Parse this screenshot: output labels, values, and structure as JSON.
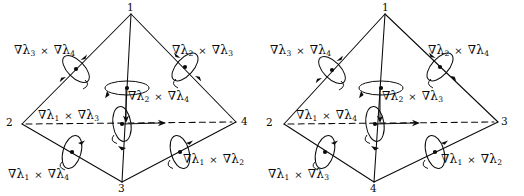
{
  "figure": {
    "name": "tetrahedron-edge-curl-diagram",
    "ink_color": "#0a0a0a",
    "background_color": "#ffffff",
    "panel_count": 2
  },
  "panels": [
    {
      "id": "left-tetrahedron",
      "vertices": [
        {
          "id": "apex",
          "label": "1"
        },
        {
          "id": "left",
          "label": "2"
        },
        {
          "id": "bottom",
          "label": "3"
        },
        {
          "id": "right",
          "label": "4"
        }
      ],
      "labels": [
        {
          "id": "top-left",
          "text": "∇λ3 × ∇λ4",
          "a": "3",
          "b": "4"
        },
        {
          "id": "top-right",
          "text": "∇λ2 × ∇λ3",
          "a": "2",
          "b": "3"
        },
        {
          "id": "center",
          "text": "∇λ2 × ∇λ4",
          "a": "2",
          "b": "4"
        },
        {
          "id": "middle-left",
          "text": "∇λ1 × ∇λ3",
          "a": "1",
          "b": "3"
        },
        {
          "id": "bottom-left",
          "text": "∇λ1 × ∇λ4",
          "a": "1",
          "b": "4"
        },
        {
          "id": "bottom-right",
          "text": "∇λ1 × ∇λ2",
          "a": "1",
          "b": "2"
        }
      ]
    },
    {
      "id": "right-tetrahedron",
      "vertices": [
        {
          "id": "apex",
          "label": "1"
        },
        {
          "id": "left",
          "label": "2"
        },
        {
          "id": "bottom",
          "label": "4"
        },
        {
          "id": "right",
          "label": "3"
        }
      ],
      "labels": [
        {
          "id": "top-left",
          "text": "∇λ3 × ∇λ4",
          "a": "3",
          "b": "4"
        },
        {
          "id": "top-right",
          "text": "∇λ2 × ∇λ4",
          "a": "2",
          "b": "4"
        },
        {
          "id": "center",
          "text": "∇λ2 × ∇λ3",
          "a": "2",
          "b": "3"
        },
        {
          "id": "middle-left",
          "text": "∇λ1 × ∇λ4",
          "a": "1",
          "b": "4"
        },
        {
          "id": "bottom-left",
          "text": "∇λ1 × ∇λ3",
          "a": "1",
          "b": "3"
        },
        {
          "id": "bottom-right",
          "text": "∇λ1 × ∇λ2",
          "a": "1",
          "b": "2"
        }
      ]
    }
  ],
  "symbols": {
    "nabla": "∇",
    "lambda": "λ",
    "times": "×"
  }
}
